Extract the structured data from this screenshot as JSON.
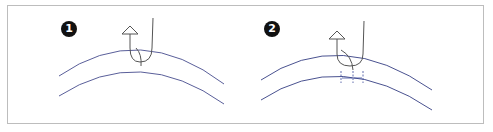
{
  "panels": [
    {
      "step": "1",
      "description": "Hook/probe inserted through curved layer, arrow pointing up"
    },
    {
      "step": "2",
      "description": "Hook/probe with dimension markers below inner curve"
    }
  ],
  "colors": {
    "curve": "#5a5f9a",
    "probe": "#555555",
    "badge": "#111111",
    "border": "#bdbdbd",
    "dimension": "#3a4a9a"
  }
}
